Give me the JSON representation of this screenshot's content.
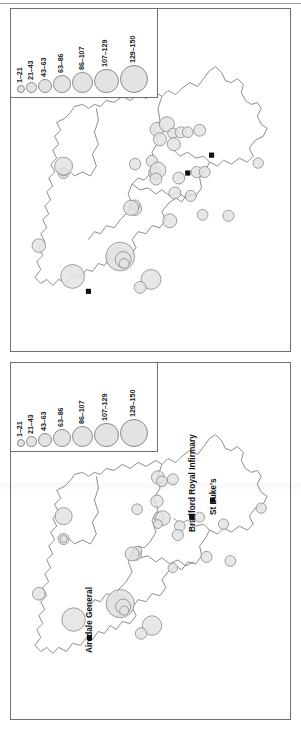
{
  "figure": {
    "orientation": "rotated-90",
    "panel_count": 2,
    "colors": {
      "circle_fill": "#e3e3e3",
      "circle_stroke": "#8a8a8a",
      "boundary_stroke": "#6f6f6f",
      "hospital_marker": "#101010",
      "frame": "#6f6f6f",
      "background": "#ffffff"
    }
  },
  "legend": {
    "name": "graduated-circle-legend",
    "classes": [
      {
        "label": "1–21",
        "r": 4.0
      },
      {
        "label": "21–43",
        "r": 5.4
      },
      {
        "label": "43–63",
        "r": 7.0
      },
      {
        "label": "63–86",
        "r": 8.8
      },
      {
        "label": "86–107",
        "r": 10.4
      },
      {
        "label": "107–129",
        "r": 12.2
      },
      {
        "label": "129–150",
        "r": 14.0
      }
    ]
  },
  "panels": [
    {
      "id": "panel-top",
      "name": "map-panel-top",
      "hospitals": [
        {
          "name": "airedale-general",
          "label": "",
          "x": 88,
          "y": 292
        },
        {
          "name": "bradford-royal-infirmary",
          "label": "",
          "x": 188,
          "y": 173
        },
        {
          "name": "st-lukes",
          "label": "",
          "x": 212,
          "y": 155
        }
      ],
      "circles": [
        {
          "cx": 157,
          "cy": 129,
          "r": 7.0
        },
        {
          "cx": 160,
          "cy": 139,
          "r": 6.6
        },
        {
          "cx": 167,
          "cy": 124,
          "r": 7.6
        },
        {
          "cx": 173,
          "cy": 133,
          "r": 5.2
        },
        {
          "cx": 174,
          "cy": 144,
          "r": 6.6
        },
        {
          "cx": 181,
          "cy": 132,
          "r": 5.6
        },
        {
          "cx": 188,
          "cy": 132,
          "r": 5.4
        },
        {
          "cx": 200,
          "cy": 130,
          "r": 6.0
        },
        {
          "cx": 152,
          "cy": 161,
          "r": 5.8
        },
        {
          "cx": 135,
          "cy": 164,
          "r": 5.8
        },
        {
          "cx": 155,
          "cy": 173,
          "r": 6.4
        },
        {
          "cx": 158,
          "cy": 170,
          "r": 8.0
        },
        {
          "cx": 156,
          "cy": 179,
          "r": 6.0
        },
        {
          "cx": 179,
          "cy": 178,
          "r": 6.0
        },
        {
          "cx": 175,
          "cy": 193,
          "r": 6.0
        },
        {
          "cx": 191,
          "cy": 196,
          "r": 5.6
        },
        {
          "cx": 197,
          "cy": 172,
          "r": 5.6
        },
        {
          "cx": 205,
          "cy": 172,
          "r": 5.6
        },
        {
          "cx": 259,
          "cy": 163,
          "r": 5.2
        },
        {
          "cx": 203,
          "cy": 215,
          "r": 5.4
        },
        {
          "cx": 229,
          "cy": 216,
          "r": 5.6
        },
        {
          "cx": 170,
          "cy": 221,
          "r": 7.0
        },
        {
          "cx": 135,
          "cy": 209,
          "r": 6.6
        },
        {
          "cx": 135,
          "cy": 205,
          "r": 5.0
        },
        {
          "cx": 131,
          "cy": 208,
          "r": 7.6
        },
        {
          "cx": 63,
          "cy": 173,
          "r": 5.6
        },
        {
          "cx": 63,
          "cy": 172,
          "r": 4.0
        },
        {
          "cx": 63,
          "cy": 166,
          "r": 9.0
        },
        {
          "cx": 38,
          "cy": 246,
          "r": 6.8
        },
        {
          "cx": 72,
          "cy": 277,
          "r": 12.0
        },
        {
          "cx": 118,
          "cy": 259,
          "r": 11.0
        },
        {
          "cx": 120,
          "cy": 257,
          "r": 14.5
        },
        {
          "cx": 123,
          "cy": 260,
          "r": 8.0
        },
        {
          "cx": 124,
          "cy": 264,
          "r": 5.0
        },
        {
          "cx": 151,
          "cy": 280,
          "r": 10.0
        },
        {
          "cx": 140,
          "cy": 288,
          "r": 6.0
        }
      ]
    },
    {
      "id": "panel-bottom",
      "name": "map-panel-bottom",
      "hospitals": [
        {
          "name": "airedale-general",
          "label": "Airedale General",
          "x": 89,
          "y": 638
        },
        {
          "name": "bradford-royal-infirmary",
          "label": "Bradford Royal Infirmary",
          "x": 192,
          "y": 517
        },
        {
          "name": "st-lukes",
          "label": "St Luke's",
          "x": 213,
          "y": 500
        }
      ],
      "circles": [
        {
          "cx": 158,
          "cy": 477,
          "r": 6.6
        },
        {
          "cx": 162,
          "cy": 481,
          "r": 5.4
        },
        {
          "cx": 173,
          "cy": 479,
          "r": 5.6
        },
        {
          "cx": 157,
          "cy": 501,
          "r": 6.2
        },
        {
          "cx": 137,
          "cy": 509,
          "r": 5.4
        },
        {
          "cx": 159,
          "cy": 517,
          "r": 5.2
        },
        {
          "cx": 163,
          "cy": 518,
          "r": 7.4
        },
        {
          "cx": 158,
          "cy": 524,
          "r": 4.4
        },
        {
          "cx": 180,
          "cy": 526,
          "r": 5.4
        },
        {
          "cx": 178,
          "cy": 535,
          "r": 5.6
        },
        {
          "cx": 200,
          "cy": 517,
          "r": 5.0
        },
        {
          "cx": 224,
          "cy": 524,
          "r": 5.2
        },
        {
          "cx": 262,
          "cy": 508,
          "r": 5.2
        },
        {
          "cx": 207,
          "cy": 557,
          "r": 5.6
        },
        {
          "cx": 231,
          "cy": 561,
          "r": 5.4
        },
        {
          "cx": 173,
          "cy": 568,
          "r": 4.8
        },
        {
          "cx": 136,
          "cy": 555,
          "r": 5.4
        },
        {
          "cx": 137,
          "cy": 551,
          "r": 4.6
        },
        {
          "cx": 132,
          "cy": 554,
          "r": 7.0
        },
        {
          "cx": 63,
          "cy": 516,
          "r": 8.6
        },
        {
          "cx": 63,
          "cy": 539,
          "r": 5.6
        },
        {
          "cx": 63,
          "cy": 539,
          "r": 3.6
        },
        {
          "cx": 38,
          "cy": 594,
          "r": 6.4
        },
        {
          "cx": 73,
          "cy": 620,
          "r": 11.8
        },
        {
          "cx": 118,
          "cy": 606,
          "r": 10.8
        },
        {
          "cx": 120,
          "cy": 604,
          "r": 14.2
        },
        {
          "cx": 123,
          "cy": 607,
          "r": 7.6
        },
        {
          "cx": 124,
          "cy": 611,
          "r": 4.6
        },
        {
          "cx": 152,
          "cy": 626,
          "r": 9.8
        },
        {
          "cx": 141,
          "cy": 634,
          "r": 5.8
        }
      ]
    }
  ]
}
